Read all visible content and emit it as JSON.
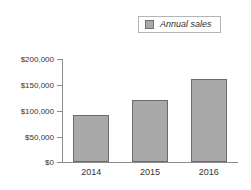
{
  "chart_data": {
    "type": "bar",
    "title": "",
    "subtitle": "",
    "xlabel": "",
    "ylabel": "",
    "categories": [
      "2014",
      "2015",
      "2016"
    ],
    "values": [
      92000,
      120000,
      161000
    ],
    "series": [
      {
        "name": "Annual sales",
        "values": [
          92000,
          120000,
          161000
        ],
        "color": "#a9a9a9"
      }
    ],
    "ylim": [
      0,
      200000
    ],
    "ytick_values": [
      200000,
      150000,
      100000,
      50000,
      0
    ],
    "ytick_labels": [
      "$200,000",
      "$150,000",
      "$100,000",
      "$50,000",
      "$0"
    ],
    "grid": false,
    "legend": {
      "position": "top-right",
      "entries": [
        {
          "label": "Annual sales",
          "swatch_color": "#a9a9a9"
        }
      ]
    },
    "axis_color": "#8c8c8c",
    "bar_border_color": "#6b6b6b"
  },
  "legend": {
    "label": "Annual sales"
  },
  "axes": {
    "y_labels": [
      "$200,000",
      "$150,000",
      "$100,000",
      "$50,000",
      "$0"
    ],
    "x_labels": [
      "2014",
      "2015",
      "2016"
    ]
  }
}
